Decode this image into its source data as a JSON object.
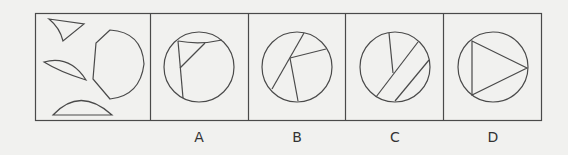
{
  "puzzle": {
    "question_panel": {
      "description": "Four cut pieces: small curved triangle, thin lens segment, circular segment, large polygon-arc piece"
    },
    "options": [
      {
        "label": "A"
      },
      {
        "label": "B"
      },
      {
        "label": "C"
      },
      {
        "label": "D"
      }
    ]
  },
  "style": {
    "line_color": "#4a4a4a",
    "background": "#f1f1ef"
  }
}
